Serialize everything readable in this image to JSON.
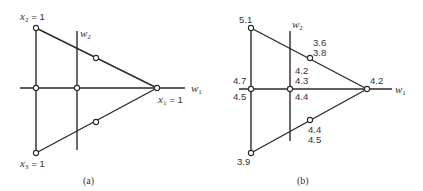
{
  "panel_a": {
    "caption": "(a)",
    "axes": {
      "horizontal": "w",
      "horizontal_sub": "1",
      "vertical": "w",
      "vertical_sub": "2"
    },
    "vertex_labels": {
      "top": {
        "var": "x",
        "sub": "2",
        "value": "= 1"
      },
      "right": {
        "var": "x",
        "sub": "1",
        "value": "= 1"
      },
      "bottom": {
        "var": "x",
        "sub": "3",
        "value": "= 1"
      }
    }
  },
  "panel_b": {
    "caption": "(b)",
    "axes": {
      "horizontal": "w",
      "horizontal_sub": "1",
      "vertical": "w",
      "vertical_sub": "2"
    },
    "values": {
      "top_vertex": "5.1",
      "right_vertex": "4.2",
      "bottom_vertex": "3.9",
      "upper_mid_1": "3.6",
      "upper_mid_2": "3.8",
      "center_1": "4.2",
      "center_2": "4.3",
      "center_3": "4.4",
      "left_mid_upper": "4.7",
      "left_mid_lower": "4.5",
      "lower_mid_1": "4.4",
      "lower_mid_2": "4.5"
    }
  },
  "colors": {
    "ink": "#2a2a2a",
    "background": "#ffffff"
  }
}
